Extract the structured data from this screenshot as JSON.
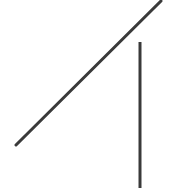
{
  "diagram": {
    "background": "#ffffff",
    "stroke_color": "#3a3a3a",
    "lines": [
      {
        "name": "diagonal-line",
        "x1": 16,
        "y1": 145,
        "x2": 161,
        "y2": 1,
        "width": 3
      },
      {
        "name": "vertical-line",
        "x1": 140,
        "y1": 42,
        "x2": 140,
        "y2": 188,
        "width": 3
      }
    ]
  }
}
